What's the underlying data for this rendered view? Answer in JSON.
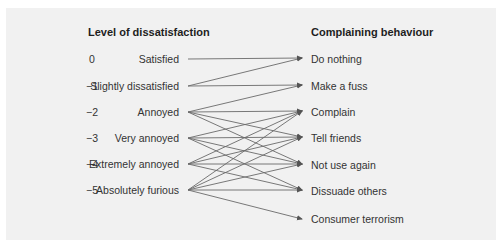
{
  "left_heading": "Level of dissatisfaction",
  "right_heading": "Complaining behaviour",
  "levels": [
    {
      "num": "0",
      "label": "Satisfied"
    },
    {
      "num": "−1",
      "label": "Slightly dissatisfied"
    },
    {
      "num": "−2",
      "label": "Annoyed"
    },
    {
      "num": "−3",
      "label": "Very annoyed"
    },
    {
      "num": "−4",
      "label": "Extremely annoyed"
    },
    {
      "num": "−5",
      "label": "Absolutely furious"
    }
  ],
  "behaviours": [
    {
      "label": "Do nothing"
    },
    {
      "label": "Make a fuss"
    },
    {
      "label": "Complain"
    },
    {
      "label": "Tell friends"
    },
    {
      "label": "Not use again"
    },
    {
      "label": "Dissuade others"
    },
    {
      "label": "Consumer terrorism"
    }
  ],
  "links": [
    [
      0,
      0
    ],
    [
      1,
      0
    ],
    [
      1,
      1
    ],
    [
      2,
      1
    ],
    [
      2,
      2
    ],
    [
      2,
      3
    ],
    [
      2,
      4
    ],
    [
      3,
      2
    ],
    [
      3,
      3
    ],
    [
      3,
      4
    ],
    [
      3,
      5
    ],
    [
      4,
      2
    ],
    [
      4,
      3
    ],
    [
      4,
      4
    ],
    [
      4,
      5
    ],
    [
      5,
      2
    ],
    [
      5,
      3
    ],
    [
      5,
      4
    ],
    [
      5,
      5
    ],
    [
      5,
      6
    ]
  ],
  "colors": {
    "line": "#6a6a6a",
    "panel": "#f1f1f1",
    "text": "#333333"
  }
}
